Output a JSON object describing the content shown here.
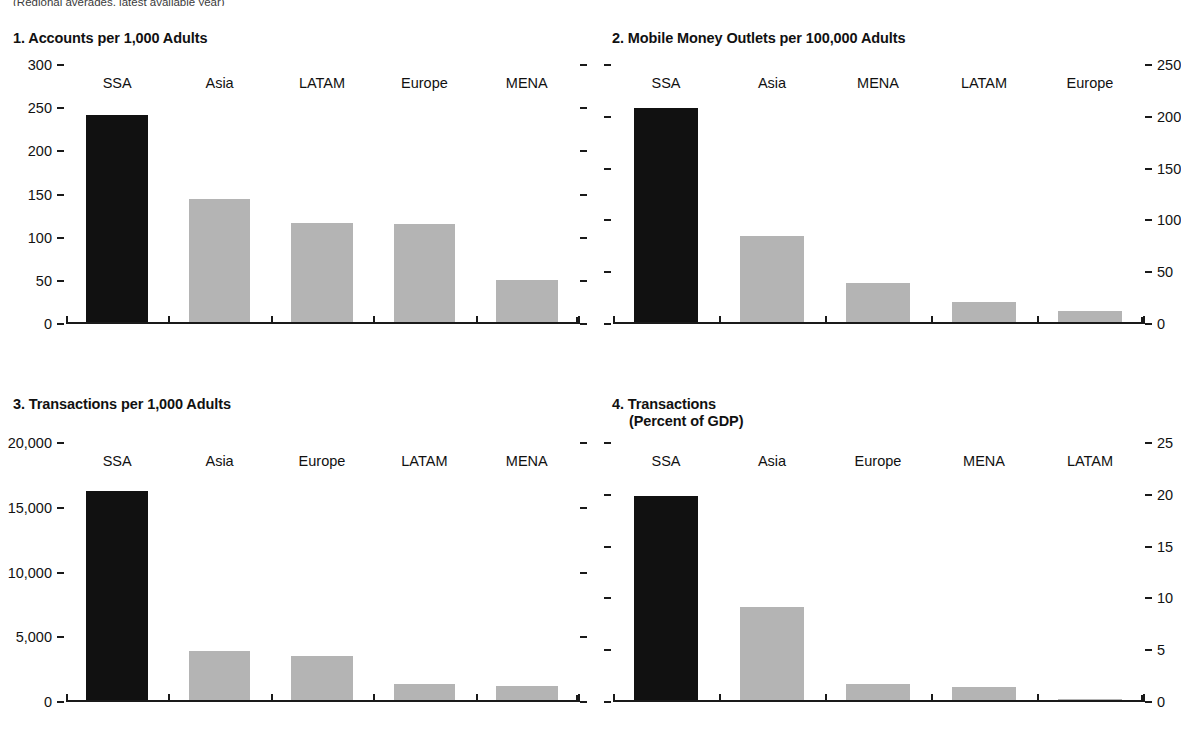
{
  "figure": {
    "subnote": "(Regional averages, latest available year)",
    "colors": {
      "highlight": "#111111",
      "other": "#b4b4b4",
      "axis": "#1a1a1a"
    }
  },
  "chart_data": [
    {
      "id": "panel1",
      "type": "bar",
      "title": "1. Accounts per 1,000 Adults",
      "xlabel": "",
      "ylabel": "",
      "ylim": [
        0,
        300
      ],
      "yticks": [
        0,
        50,
        100,
        150,
        200,
        250,
        300
      ],
      "ytick_labels": [
        "0",
        "50",
        "100",
        "150",
        "200",
        "250",
        "300"
      ],
      "axis_side": "left",
      "mirror_ticks": true,
      "grid": false,
      "legend": "none",
      "categories": [
        "SSA",
        "Asia",
        "LATAM",
        "Europe",
        "MENA"
      ],
      "values": [
        240,
        143,
        115,
        113,
        49
      ],
      "highlight_index": 0
    },
    {
      "id": "panel2",
      "type": "bar",
      "title": "2. Mobile Money Outlets per 100,000 Adults",
      "xlabel": "",
      "ylabel": "",
      "ylim": [
        0,
        250
      ],
      "yticks": [
        0,
        50,
        100,
        150,
        200,
        250
      ],
      "ytick_labels": [
        "0",
        "50",
        "100",
        "150",
        "200",
        "250"
      ],
      "axis_side": "right",
      "mirror_ticks": true,
      "grid": false,
      "legend": "none",
      "categories": [
        "SSA",
        "Asia",
        "MENA",
        "LATAM",
        "Europe"
      ],
      "values": [
        207,
        83,
        38,
        19,
        11
      ],
      "highlight_index": 0
    },
    {
      "id": "panel3",
      "type": "bar",
      "title": "3. Transactions per 1,000 Adults",
      "xlabel": "",
      "ylabel": "",
      "ylim": [
        0,
        20000
      ],
      "yticks": [
        0,
        5000,
        10000,
        15000,
        20000
      ],
      "ytick_labels": [
        "0",
        "5,000",
        "10,000",
        "15,000",
        "20,000"
      ],
      "axis_side": "left",
      "mirror_ticks": true,
      "grid": false,
      "legend": "none",
      "categories": [
        "SSA",
        "Asia",
        "Europe",
        "LATAM",
        "MENA"
      ],
      "values": [
        16150,
        3770,
        3400,
        1230,
        1080
      ],
      "highlight_index": 0
    },
    {
      "id": "panel4",
      "type": "bar",
      "title": "4. Transactions",
      "title_line2": "(Percent of GDP)",
      "xlabel": "",
      "ylabel": "",
      "ylim": [
        0,
        25
      ],
      "yticks": [
        0,
        5,
        10,
        15,
        20,
        25
      ],
      "ytick_labels": [
        "0",
        "5",
        "10",
        "15",
        "20",
        "25"
      ],
      "axis_side": "right",
      "mirror_ticks": true,
      "grid": false,
      "legend": "none",
      "categories": [
        "SSA",
        "Asia",
        "Europe",
        "MENA",
        "LATAM"
      ],
      "values": [
        19.7,
        9.0,
        1.55,
        1.25,
        0.1
      ],
      "highlight_index": 0
    }
  ]
}
